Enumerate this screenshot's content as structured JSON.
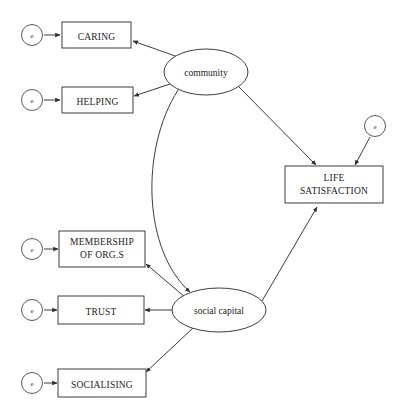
{
  "diagram": {
    "type": "structural-equation-model-path-diagram",
    "background_color": "#ffffff",
    "stroke_color": "#3d3d3d",
    "text_color": "#1a1a1a"
  },
  "indicators": [
    {
      "id": "caring",
      "lines": [
        "CARING"
      ],
      "error_label": "e"
    },
    {
      "id": "helping",
      "lines": [
        "HELPING"
      ],
      "error_label": "e"
    },
    {
      "id": "membership",
      "lines": [
        "MEMBERSHIP",
        "OF ORG.S"
      ],
      "error_label": "e"
    },
    {
      "id": "trust",
      "lines": [
        "TRUST"
      ],
      "error_label": "e"
    },
    {
      "id": "socialising",
      "lines": [
        "SOCIALISING"
      ],
      "error_label": "e"
    }
  ],
  "latents": [
    {
      "id": "community",
      "label": "community"
    },
    {
      "id": "social_capital",
      "label": "social capital"
    }
  ],
  "outcome": {
    "id": "life_satisfaction",
    "lines": [
      "LIFE",
      "SATISFACTION"
    ],
    "error_label": "e"
  },
  "labels": {
    "caring": "CARING",
    "helping": "HELPING",
    "membership_line1": "MEMBERSHIP",
    "membership_line2": "OF ORG.S",
    "trust": "TRUST",
    "socialising": "SOCIALISING",
    "community": "community",
    "social_capital": "social capital",
    "life_line1": "LIFE",
    "life_line2": "SATISFACTION",
    "error": "e"
  },
  "paths": [
    {
      "from": "community",
      "to": "caring",
      "kind": "directed"
    },
    {
      "from": "community",
      "to": "helping",
      "kind": "directed"
    },
    {
      "from": "social_capital",
      "to": "membership",
      "kind": "directed"
    },
    {
      "from": "social_capital",
      "to": "trust",
      "kind": "directed"
    },
    {
      "from": "social_capital",
      "to": "socialising",
      "kind": "directed"
    },
    {
      "from": "community",
      "to": "life_satisfaction",
      "kind": "directed"
    },
    {
      "from": "social_capital",
      "to": "life_satisfaction",
      "kind": "directed"
    },
    {
      "from": "community",
      "to": "social_capital",
      "kind": "covariance-double-headed-curve"
    },
    {
      "from": "e_caring",
      "to": "caring",
      "kind": "directed"
    },
    {
      "from": "e_helping",
      "to": "helping",
      "kind": "directed"
    },
    {
      "from": "e_membership",
      "to": "membership",
      "kind": "directed"
    },
    {
      "from": "e_trust",
      "to": "trust",
      "kind": "directed"
    },
    {
      "from": "e_socialising",
      "to": "socialising",
      "kind": "directed"
    },
    {
      "from": "e_life",
      "to": "life_satisfaction",
      "kind": "directed"
    }
  ]
}
